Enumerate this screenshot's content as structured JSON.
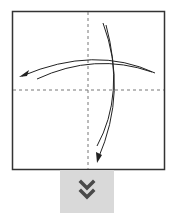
{
  "diagram": {
    "type": "origami-fold-step",
    "paper": {
      "shape": "square",
      "border_color": "#333333",
      "fill": "#ffffff"
    },
    "crease_lines": [
      {
        "orientation": "vertical",
        "style": "dashed",
        "color": "#777777"
      },
      {
        "orientation": "horizontal",
        "style": "dashed",
        "color": "#777777"
      }
    ],
    "arrows": [
      {
        "name": "fold-arrow-horizontal",
        "direction": "right-to-left",
        "style": "curved-double-line"
      },
      {
        "name": "fold-arrow-vertical",
        "direction": "top-to-bottom",
        "style": "curved-double-line"
      }
    ],
    "arrow_color": "#222222"
  },
  "next_step": {
    "icon": "double-chevron-down-icon",
    "background": "#d9d9d9",
    "icon_color": "#4a4a4a"
  }
}
